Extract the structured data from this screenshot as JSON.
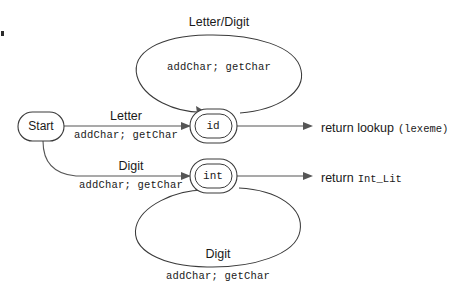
{
  "diagram": {
    "type": "state-machine",
    "colors": {
      "background": "#ffffff",
      "node_stroke": "#3a3a3a",
      "edge_stroke": "#555555",
      "text": "#1a1a1a"
    },
    "nodes": [
      {
        "id": "start",
        "label": "Start",
        "shape": "stadium",
        "accepting": false
      },
      {
        "id": "id",
        "label": "id",
        "shape": "double-stadium",
        "accepting": true
      },
      {
        "id": "int",
        "label": "int",
        "shape": "double-stadium",
        "accepting": true
      }
    ],
    "transitions": [
      {
        "from": "start",
        "to": "id",
        "condition": "Letter",
        "action": "addChar; getChar"
      },
      {
        "from": "start",
        "to": "int",
        "condition": "Digit",
        "action": "addChar; getChar"
      },
      {
        "from": "id",
        "to": "id",
        "condition": "Letter/Digit",
        "action": "addChar; getChar",
        "loop": "above"
      },
      {
        "from": "int",
        "to": "int",
        "condition": "Digit",
        "action": "addChar; getChar",
        "loop": "below"
      }
    ],
    "outputs": [
      {
        "from": "id",
        "keyword": "return lookup",
        "code": "(lexeme)"
      },
      {
        "from": "int",
        "keyword": "return",
        "code": "Int_Lit"
      }
    ]
  }
}
